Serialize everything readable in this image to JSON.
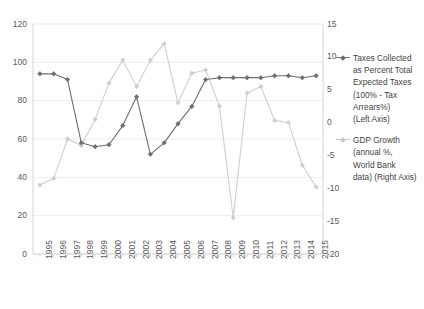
{
  "chart_data": {
    "type": "line",
    "title": "",
    "xlabel": "",
    "ylabel": "",
    "grid": true,
    "legend_position": "right",
    "categories": [
      "1995",
      "1996",
      "1997",
      "1998",
      "1999",
      "2000",
      "2001",
      "2002",
      "2003",
      "2004",
      "2005",
      "2006",
      "2007",
      "2008",
      "2009",
      "2010",
      "2011",
      "2012",
      "2013",
      "2014",
      "2015"
    ],
    "axes": {
      "left": {
        "label": "Taxes Collected as Percent Total Expected Taxes",
        "ticks": [
          0,
          20,
          40,
          60,
          80,
          100,
          120
        ],
        "tick_labels": [
          "0",
          "20",
          "40",
          "60",
          "80",
          "100",
          "120"
        ],
        "ylim": [
          0,
          120
        ]
      },
      "right": {
        "label": "GDP Growth (annual %)",
        "ticks": [
          -20,
          -15,
          -10,
          -5,
          0,
          5,
          10,
          15
        ],
        "tick_labels": [
          "-20",
          "-15",
          "-10",
          "-5",
          "0",
          "5",
          "10",
          "15"
        ],
        "ylim": [
          -20,
          15
        ]
      }
    },
    "series": [
      {
        "name": "Taxes Collected as Percent Total Expected Taxes (100% - Tax Arrears%) (Left Axis)",
        "axis": "left",
        "color": "#6e6e6e",
        "marker": "diamond",
        "values": [
          94,
          94,
          91,
          58,
          56,
          57,
          67,
          82,
          52,
          58,
          68,
          77,
          91,
          92,
          92,
          92,
          92,
          93,
          93,
          92,
          93
        ]
      },
      {
        "name": "GDP Growth (annual %, World Bank data) (Right Axis)",
        "axis": "right",
        "color": "#cfcfcf",
        "marker": "diamond",
        "values": [
          -9.5,
          -8.5,
          -2.5,
          -3.5,
          0.5,
          6.0,
          9.5,
          5.5,
          9.5,
          12.0,
          3.0,
          7.5,
          8.0,
          2.5,
          -14.5,
          4.5,
          5.5,
          0.3,
          0.0,
          -6.5,
          -9.8
        ]
      }
    ],
    "plot_area": {
      "left": 33,
      "top": 24,
      "right": 323,
      "bottom": 254
    }
  },
  "legend": {
    "entries": [
      {
        "swatch_class": "s1",
        "lines": [
          "Taxes Collected",
          "as Percent Total",
          "Expected Taxes",
          "(100% - Tax",
          "Arrears%)",
          "(Left Axis)"
        ]
      },
      {
        "swatch_class": "s2",
        "lines": [
          "GDP Growth",
          "(annual %,",
          "World Bank",
          "data) (Right Axis)"
        ]
      }
    ]
  },
  "left_axis_labels": [
    "120",
    "100",
    "80",
    "60",
    "40",
    "20",
    "0"
  ],
  "right_axis_labels": [
    "15",
    "10",
    "5",
    "0",
    "-5",
    "-10",
    "-15",
    "-20"
  ],
  "x_axis_labels": [
    "1995",
    "1996",
    "1997",
    "1998",
    "1999",
    "2000",
    "2001",
    "2002",
    "2003",
    "2004",
    "2005",
    "2006",
    "2007",
    "2008",
    "2009",
    "2010",
    "2011",
    "2012",
    "2013",
    "2014",
    "2015"
  ]
}
